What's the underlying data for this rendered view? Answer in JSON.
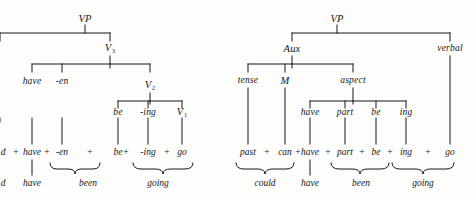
{
  "figure": {
    "kind": "syntactic-tree-pair",
    "ink_color": "#16161a",
    "paper_color": "#fdfdfb"
  },
  "left_tree": {
    "name": "v-analysis-tree",
    "nodes": {
      "root": "VP",
      "v3": "V",
      "v3_sub": "3",
      "have": "have",
      "en": "-en",
      "v2": "V",
      "v2_sub": "2",
      "be": "be",
      "ing": "-ing",
      "v1": "V",
      "v1_sub": "1"
    },
    "string_row": {
      "clipped_prefix": "d",
      "items": [
        "have",
        "-en",
        "be",
        "-ing",
        "go"
      ],
      "separator": "+"
    },
    "result_row": {
      "clipped_prefix": "d",
      "items": [
        "have",
        "been",
        "going"
      ]
    },
    "braces": [
      "been",
      "going"
    ]
  },
  "right_tree": {
    "name": "aux-analysis-tree",
    "nodes": {
      "root": "VP",
      "aux": "Aux",
      "verbal": "verbal",
      "tense": "tense",
      "modal": "M",
      "aspect": "aspect",
      "have": "have",
      "part": "part",
      "be": "be",
      "ing": "ing"
    },
    "string_row": {
      "items": [
        "past",
        "can",
        "have",
        "part",
        "be",
        "ing",
        "go"
      ],
      "separator": "+"
    },
    "result_row": {
      "items": [
        "could",
        "have",
        "been",
        "going"
      ]
    },
    "braces": [
      "could",
      "been",
      "going"
    ]
  }
}
